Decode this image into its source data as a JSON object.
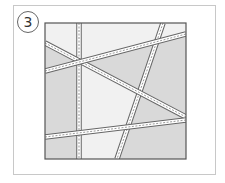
{
  "step": {
    "number": "3"
  },
  "diagram": {
    "square": {
      "x": 45,
      "y": 23,
      "w": 141,
      "h": 136,
      "border": "#555555"
    },
    "colors": {
      "light": "#f1f1f1",
      "dark": "#d9d9d9",
      "strip": "#ffffff",
      "strip_edge": "#666666",
      "stitch": "#999999"
    },
    "regions": [
      {
        "fill": "dark",
        "points": "45,43 79,61 79,159 45,159"
      },
      {
        "fill": "dark",
        "points": "79,61 140,93 160,105 186,117 186,120 126,128 117,159 186,159 186,120 126,128 140,93"
      },
      {
        "fill": "dark",
        "points": "79,61 150,44 186,34 186,117 140,93"
      },
      {
        "fill": "light",
        "points": "45,23 79,23 79,61 45,43"
      },
      {
        "fill": "light",
        "points": "79,23 163,23 150,44 79,61"
      }
    ],
    "strips": [
      {
        "name": "vertical-strip",
        "x1": 79,
        "y1": 23,
        "x2": 79,
        "y2": 159
      },
      {
        "name": "steep-diagonal-strip",
        "x1": 163,
        "y1": 23,
        "x2": 117,
        "y2": 159
      },
      {
        "name": "descending-diagonal-strip",
        "x1": 45,
        "y1": 43,
        "x2": 186,
        "y2": 117
      },
      {
        "name": "upper-rising-strip",
        "x1": 45,
        "y1": 71,
        "x2": 186,
        "y2": 34
      },
      {
        "name": "lower-rising-strip",
        "x1": 45,
        "y1": 137,
        "x2": 186,
        "y2": 120
      }
    ]
  }
}
